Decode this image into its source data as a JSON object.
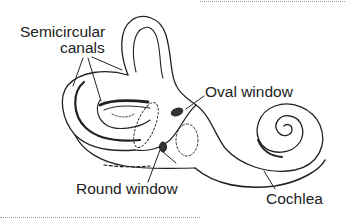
{
  "figure": {
    "labels": {
      "semicircular_canals_line1": "Semicircular",
      "semicircular_canals_line2": "canals",
      "oval_window": "Oval window",
      "round_window": "Round window",
      "cochlea": "Cochlea"
    },
    "colors": {
      "line": "#222222",
      "background": "#ffffff",
      "border_dots": "#9a9a9a"
    }
  }
}
